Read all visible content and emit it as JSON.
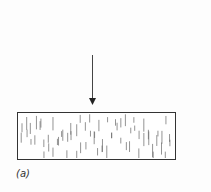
{
  "figure": {
    "label": "(a)",
    "arrow": {
      "direction": "down",
      "x": 92.5,
      "y_start": 55,
      "y_end": 105,
      "color": "#333333"
    },
    "block": {
      "x": 17,
      "y": 112,
      "width": 159,
      "height": 48,
      "fill": "#ffffff",
      "stroke": "#333333",
      "texture": "vertical-dashes"
    }
  }
}
